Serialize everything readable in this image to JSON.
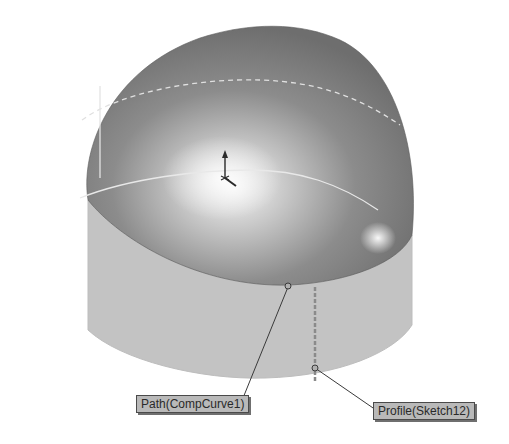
{
  "viewport": {
    "background": "#ffffff",
    "model": {
      "dome_color_dark": "#7a7a7a",
      "dome_color_light": "#f2f2f2",
      "wall_color": "#c4c4c4",
      "edge_color": "#e6e6e6"
    }
  },
  "callouts": {
    "path": {
      "label": "Path(CompCurve1)"
    },
    "profile": {
      "label": "Profile(Sketch12)"
    }
  },
  "icons": {
    "origin": "origin-triad-icon"
  }
}
